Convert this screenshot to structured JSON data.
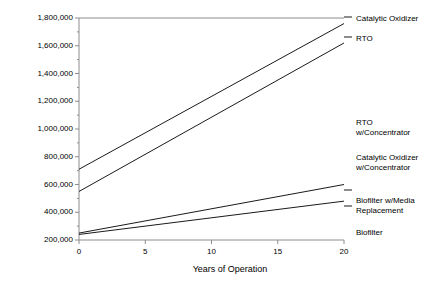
{
  "chart_data": {
    "type": "line",
    "title": "",
    "xlabel": "Years of Operation",
    "ylabel": "Cost of Ownership",
    "xlim": [
      0,
      20
    ],
    "ylim": [
      200000,
      1800000
    ],
    "x_ticks": [
      "0",
      "5",
      "10",
      "15",
      "20"
    ],
    "x_tick_values": [
      0,
      5,
      10,
      15,
      20
    ],
    "y_ticks": [
      "200,000",
      "400,000",
      "600,000",
      "800,000",
      "1,000,000",
      "1,200,000",
      "1,400,000",
      "1,600,000",
      "1,800,000"
    ],
    "y_tick_values": [
      200000,
      400000,
      600000,
      800000,
      1000000,
      1200000,
      1400000,
      1600000,
      1800000
    ],
    "y_minor_ticks": [
      300000,
      500000,
      700000,
      900000,
      1100000,
      1300000,
      1500000,
      1700000
    ],
    "grid": false,
    "legend_position": "right",
    "x": [
      0,
      20
    ],
    "series": [
      {
        "name": "Catalytic Oxidizer",
        "values": [
          710000,
          1760000
        ],
        "label_text": "Catalytic Oxidizer",
        "label_y": 14,
        "leader_to_y": 17
      },
      {
        "name": "RTO",
        "values": [
          550000,
          1620000
        ],
        "label_text": "RTO",
        "label_y": 34,
        "leader_to_y": 37
      },
      {
        "name": "RTO w/Concentrator",
        "values": [
          null,
          null
        ],
        "label_text": "RTO\nw/Concentrator",
        "label_y": 118,
        "leader_to_y": null
      },
      {
        "name": "Catalytic Oxidizer w/Concentrator",
        "values": [
          null,
          null
        ],
        "label_text": "Catalytic Oxidizer\nw/Concentrator",
        "label_y": 153,
        "leader_to_y": null
      },
      {
        "name": "Biofilter w/Media Replacement",
        "values": [
          250000,
          600000
        ],
        "label_text": "Biofilter w/Media\nReplacement",
        "label_y": 196,
        "leader_to_y": 190
      },
      {
        "name": "Biofilter",
        "values": [
          240000,
          480000
        ],
        "label_text": "Biofilter",
        "label_y": 228,
        "leader_to_y": 206
      }
    ],
    "line_color": "#1a1a1a",
    "axis_color": "#8c8c8c"
  }
}
